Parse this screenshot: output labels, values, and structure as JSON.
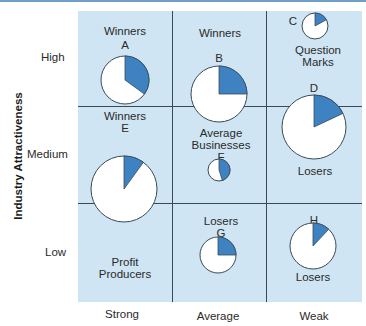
{
  "colors": {
    "grid_background": "#cfe5f3",
    "slice_fill": "#3f82c2",
    "pie_fill": "#ffffff",
    "line": "#3a4a55"
  },
  "axes": {
    "y_title": "Industry Attractiveness",
    "y_levels": [
      "High",
      "Medium",
      "Low"
    ],
    "x_levels": [
      "Strong",
      "Average",
      "Weak"
    ]
  },
  "cells": {
    "high_strong": "Winners",
    "high_average": "Winners",
    "high_weak_line1": "Question",
    "high_weak_line2": "Marks",
    "medium_strong": "Winners",
    "medium_average_line1": "Average",
    "medium_average_line2": "Businesses",
    "medium_weak": "Losers",
    "low_strong_line1": "Profit",
    "low_strong_line2": "Producers",
    "low_average": "Losers",
    "low_weak": "Losers"
  },
  "businesses": [
    {
      "id": "A",
      "share": 0.35,
      "size": "medium"
    },
    {
      "id": "B",
      "share": 0.25,
      "size": "large"
    },
    {
      "id": "C",
      "share": 0.17,
      "size": "small"
    },
    {
      "id": "D",
      "share": 0.18,
      "size": "x-large"
    },
    {
      "id": "E",
      "share": 0.1,
      "size": "x-large"
    },
    {
      "id": "F",
      "share": 0.45,
      "size": "x-small"
    },
    {
      "id": "G",
      "share": 0.25,
      "size": "small-medium"
    },
    {
      "id": "H",
      "share": 0.12,
      "size": "medium"
    }
  ]
}
